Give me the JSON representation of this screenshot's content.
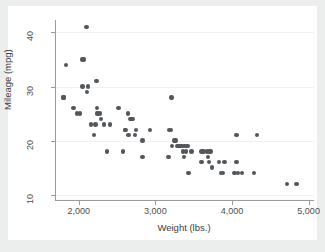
{
  "figure": {
    "background_color": "#eceded",
    "plot_background_color": "#ffffff",
    "marker_color": "#53575c",
    "axis_color": "#9a9a9a",
    "gridline_color": "#f0f0f0"
  },
  "chart_data": {
    "type": "scatter",
    "title": "",
    "xlabel": "Weight (lbs.)",
    "ylabel": "Mileage (mpg)",
    "xlim": [
      1690,
      5070
    ],
    "ylim": [
      9.2,
      42.3
    ],
    "xticks": [
      2000,
      3000,
      4000,
      5000
    ],
    "xticklabels": [
      "2,000",
      "3,000",
      "4,000",
      "5,000"
    ],
    "yticks": [
      10,
      20,
      30,
      40
    ],
    "yticklabels": [
      "10",
      "20",
      "30",
      "40"
    ],
    "grid": "horizontal",
    "legend": "none",
    "series": [
      {
        "name": "Mileage vs Weight",
        "x": [
          1800,
          1800,
          1830,
          1930,
          1980,
          2020,
          2050,
          2050,
          2070,
          2100,
          2110,
          2120,
          2160,
          2200,
          2220,
          2230,
          2240,
          2240,
          2250,
          2280,
          2290,
          2330,
          2370,
          2410,
          2520,
          2580,
          2600,
          2610,
          2640,
          2650,
          2670,
          2690,
          2700,
          2730,
          2750,
          2830,
          2830,
          2930,
          3170,
          3180,
          3200,
          3210,
          3220,
          3250,
          3260,
          3280,
          3300,
          3310,
          3330,
          3350,
          3360,
          3370,
          3380,
          3400,
          3420,
          3430,
          3470,
          3600,
          3600,
          3630,
          3670,
          3690,
          3700,
          3700,
          3720,
          3740,
          3830,
          3860,
          3880,
          3900,
          4030,
          4060,
          4060,
          4080,
          4130,
          4290,
          4330,
          4720,
          4840
        ],
        "y": [
          28,
          28,
          34,
          26,
          25,
          25,
          30,
          35,
          35,
          41,
          29,
          30,
          23,
          21,
          23,
          31,
          26,
          25,
          25,
          25,
          24,
          23,
          18,
          23,
          26,
          18,
          22,
          22,
          25,
          21,
          24,
          24,
          24,
          21,
          22,
          17,
          20,
          22,
          17,
          22,
          22,
          28,
          19,
          20,
          20,
          19,
          19,
          19,
          19,
          19,
          18,
          17,
          19,
          18,
          19,
          14,
          18,
          16,
          18,
          18,
          18,
          17,
          18,
          16,
          18,
          15,
          16,
          14,
          14,
          16,
          14,
          21,
          16,
          14,
          14,
          14,
          21,
          12,
          12
        ]
      }
    ]
  }
}
